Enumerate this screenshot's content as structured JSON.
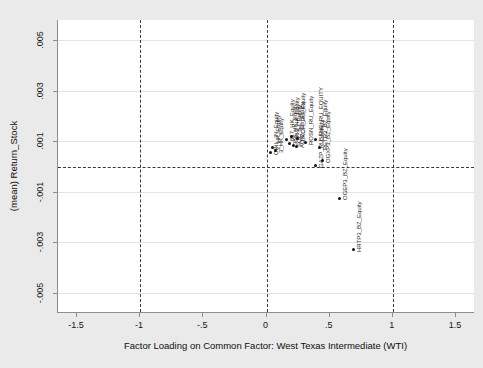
{
  "chart_data": {
    "type": "scatter",
    "title": "",
    "xlabel": "Factor Loading on Common Factor: West Texas Intermediate (WTI)",
    "ylabel": "(mean) Return_Stock",
    "xlim": [
      -1.65,
      1.65
    ],
    "ylim": [
      -0.0058,
      0.0058
    ],
    "xticks": [
      -1.5,
      -1,
      -0.5,
      0,
      0.5,
      1,
      1.5
    ],
    "xticklabels": [
      "-1.5",
      "-1",
      "-.5",
      "0",
      ".5",
      "1",
      "1.5"
    ],
    "yticks": [
      0.005,
      0.003,
      0.001,
      -0.001,
      -0.003,
      -0.005
    ],
    "yticklabels": [
      ".005",
      ".003",
      ".001",
      "-.001",
      "-.003",
      "-.005"
    ],
    "grid": "horizontal-light",
    "reference_lines": {
      "vertical": [
        -1,
        0,
        1
      ],
      "horizontal": [
        0
      ],
      "style": "dashed"
    },
    "legend": "none",
    "points": [
      {
        "label": "OINL_IN_Equity",
        "x": 0.03,
        "y": 0.00055
      },
      {
        "label": "2_HK_Equity",
        "x": 0.045,
        "y": 0.00075
      },
      {
        "label": "3_HK_Equity",
        "x": 0.075,
        "y": 0.00062
      },
      {
        "label": "857_HK_Equity",
        "x": 0.155,
        "y": 0.00108
      },
      {
        "label": "883_HK_Equity",
        "x": 0.2,
        "y": 0.00118
      },
      {
        "label": "LKOH_RU_Equity",
        "x": 0.245,
        "y": 0.0011
      },
      {
        "label": "386_HK_Equity",
        "x": 0.185,
        "y": 0.00092
      },
      {
        "label": "SQL_SJ_Equity",
        "x": 0.21,
        "y": 0.00085
      },
      {
        "label": "AOIC_SS_Equity",
        "x": 0.24,
        "y": 0.0008
      },
      {
        "label": "ROSN_RU_Equity",
        "x": 0.305,
        "y": 0.00095
      },
      {
        "label": "BANE_RU_EQUITY",
        "x": 0.39,
        "y": 0.00108
      },
      {
        "label": "PETR3_BZ_Equity",
        "x": 0.42,
        "y": 0.00075
      },
      {
        "label": "OGXP3_BZ_Equity",
        "x": 0.445,
        "y": 0.00022
      },
      {
        "label": "GAZP_RU_Equity",
        "x": 0.385,
        "y": 2e-05
      },
      {
        "label": "OGEP3_BZ_Equity",
        "x": 0.58,
        "y": -0.00125
      },
      {
        "label": "HRTP3_BZ_Equity",
        "x": 0.69,
        "y": -0.0033
      }
    ]
  }
}
